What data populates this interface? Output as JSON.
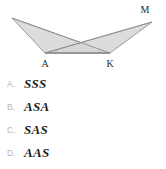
{
  "figure": {
    "name": "two-triangles-bowtie",
    "fill_color": "#d4d4d4",
    "stroke_color": "#8a8a8a",
    "label_color": "#2b2b2b",
    "vertices": [
      {
        "id": "left-apex",
        "label": "",
        "x": 12,
        "y": 18
      },
      {
        "id": "A",
        "label": "A",
        "x": 45,
        "y": 53,
        "label_x": 45,
        "label_y": 66
      },
      {
        "id": "K",
        "label": "K",
        "x": 110,
        "y": 53,
        "label_x": 110,
        "label_y": 66
      },
      {
        "id": "M",
        "label": "M",
        "x": 152,
        "y": 22,
        "label_x": 143,
        "label_y": 11
      }
    ],
    "triangles": [
      {
        "id": "triangle-left",
        "points": "12,18 110,53 45,53"
      },
      {
        "id": "triangle-right",
        "points": "152,22 45,53 110,53"
      }
    ],
    "segments": [
      {
        "id": "segment-A-K",
        "x1": 45,
        "y1": 53,
        "x2": 110,
        "y2": 53
      },
      {
        "id": "segment-left-apex-to-K",
        "x1": 12,
        "y1": 18,
        "x2": 110,
        "y2": 53
      },
      {
        "id": "segment-left-apex-to-A",
        "x1": 12,
        "y1": 18,
        "x2": 45,
        "y2": 53
      },
      {
        "id": "segment-M-to-A",
        "x1": 152,
        "y1": 22,
        "x2": 45,
        "y2": 53
      },
      {
        "id": "segment-M-to-K",
        "x1": 152,
        "y1": 22,
        "x2": 110,
        "y2": 53
      }
    ],
    "angle_marks": [
      {
        "id": "angle-mark-A",
        "at": "A"
      },
      {
        "id": "angle-mark-K",
        "at": "K"
      }
    ],
    "intersection": {
      "x": 78,
      "y": 43
    }
  },
  "options": [
    {
      "letter": "A.",
      "text": "SSS"
    },
    {
      "letter": "B.",
      "text": "ASA"
    },
    {
      "letter": "C.",
      "text": "SAS"
    },
    {
      "letter": "D.",
      "text": "AAS"
    }
  ]
}
